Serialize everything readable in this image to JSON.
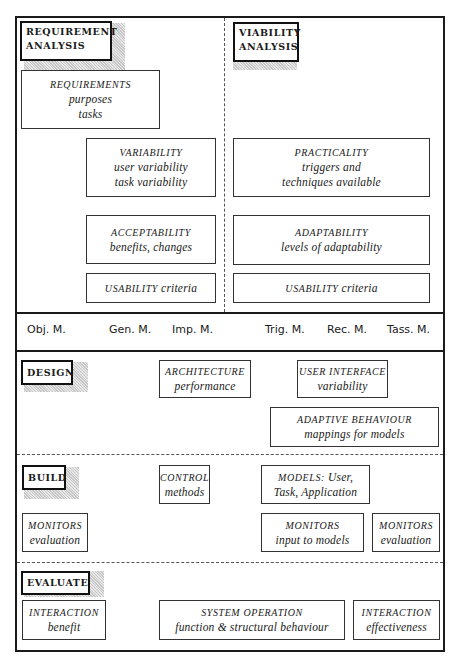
{
  "analysis": {
    "requirement": {
      "heading": [
        "REQUIREMENT",
        "ANALYSIS"
      ],
      "boxes": [
        {
          "title": "REQUIREMENTS",
          "lines": [
            "purposes",
            "tasks"
          ]
        },
        {
          "title": "VARIABILITY",
          "lines": [
            "user variability",
            "task variability"
          ]
        },
        {
          "title": "ACCEPTABILITY",
          "lines": [
            "benefits, changes"
          ]
        },
        {
          "title": "USABILITY",
          "suffix": "criteria"
        }
      ]
    },
    "viability": {
      "heading": [
        "VIABILITY",
        "ANALYSIS"
      ],
      "boxes": [
        {
          "title": "PRACTICALITY",
          "lines": [
            "triggers and",
            "techniques available"
          ]
        },
        {
          "title": "ADAPTABILITY",
          "lines": [
            "levels of adaptability"
          ]
        },
        {
          "title": "USABILITY",
          "suffix": "criteria"
        }
      ]
    }
  },
  "models_band": [
    "Obj. M.",
    "Gen. M.",
    "Imp. M.",
    "Trig. M.",
    "Rec. M.",
    "Tass. M."
  ],
  "design": {
    "heading": "DESIGN",
    "boxes": [
      {
        "title": "ARCHITECTURE",
        "lines": [
          "performance"
        ]
      },
      {
        "title": "USER INTERFACE",
        "lines": [
          "variability"
        ]
      },
      {
        "title": "ADAPTIVE BEHAVIOUR",
        "lines": [
          "mappings for models"
        ]
      }
    ]
  },
  "build": {
    "heading": "BUILD",
    "boxes": [
      {
        "title": "CONTROL",
        "lines": [
          "methods"
        ]
      },
      {
        "title": "MODELS:",
        "title_suffix": "User,",
        "lines": [
          "Task, Application"
        ]
      },
      {
        "title": "MONITORS",
        "lines": [
          "evaluation"
        ]
      },
      {
        "title": "MONITORS",
        "lines": [
          "input to models"
        ]
      },
      {
        "title": "MONITORS",
        "lines": [
          "evaluation"
        ]
      }
    ]
  },
  "evaluate": {
    "heading": "EVALUATE",
    "boxes": [
      {
        "title": "INTERACTION",
        "lines": [
          "benefit"
        ]
      },
      {
        "title": "SYSTEM OPERATION",
        "lines": [
          "function & structural behaviour"
        ]
      },
      {
        "title": "INTERACTION",
        "lines": [
          "effectiveness"
        ]
      }
    ]
  }
}
